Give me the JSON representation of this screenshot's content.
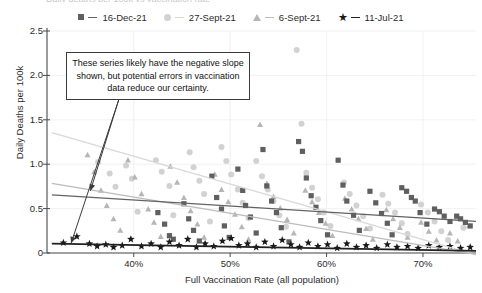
{
  "title_sliver": "Daily deaths per 100k vs vaccination rate",
  "legend": {
    "entries": [
      {
        "label": "16-Dec-21",
        "marker": "square-marker",
        "color": "#5f5f5f",
        "line_color": "#636363"
      },
      {
        "label": "27-Sept-21",
        "marker": "circle-marker",
        "color": "#d2d2d2",
        "line_color": "#d8d8d8"
      },
      {
        "label": "6-Sept-21",
        "marker": "triangle-marker",
        "color": "#b6b6b6",
        "line_color": "#bcbcbc"
      },
      {
        "label": "11-Jul-21",
        "marker": "star-marker",
        "color": "#1a1a1a",
        "line_color": "#202020"
      }
    ]
  },
  "annotation": {
    "text": "These series likely have the negative slope shown, but potential errors in vaccination data reduce our certainty."
  },
  "axes": {
    "y_title": "Daily Deaths per 100k",
    "x_title": "Full Vaccination Rate (all population)",
    "y_ticks": [
      "0",
      "0.5",
      "1.0",
      "1.5",
      "2.0",
      "2.5"
    ],
    "x_ticks": [
      "40%",
      "50%",
      "60%",
      "70%"
    ]
  },
  "chart_data": {
    "type": "scatter",
    "title": "Daily deaths per 100k vs vaccination rate",
    "xlabel": "Full Vaccination Rate (all population)",
    "ylabel": "Daily Deaths per 100k",
    "xlim": [
      0.31,
      0.755
    ],
    "ylim": [
      0,
      2.5
    ],
    "xticks": [
      0.4,
      0.5,
      0.6,
      0.7
    ],
    "xticklabels": [
      "40%",
      "50%",
      "60%",
      "70%"
    ],
    "yticks": [
      0,
      0.5,
      1.0,
      1.5,
      2.0,
      2.5
    ],
    "yticklabels": [
      "0",
      "0.5",
      "1.0",
      "1.5",
      "2.0",
      "2.5"
    ],
    "grid": "both-faint",
    "legend_position": "top-center",
    "annotations": [
      {
        "text": "These series likely have the negative slope shown, but potential errors in vaccination data reduce our certainty.",
        "box_x": 0.335,
        "box_y": 2.22,
        "arrows": [
          {
            "to_x": 0.335,
            "to_y": 0.11
          },
          {
            "to_x": 0.355,
            "to_y": 0.7
          }
        ]
      }
    ],
    "series": [
      {
        "name": "16-Dec-21",
        "marker": "square",
        "color": "#5f5f5f",
        "trendline": {
          "color": "#636363",
          "x0": 0.315,
          "y0": 0.655,
          "x1": 0.755,
          "y1": 0.355
        },
        "points": [
          [
            0.425,
            0.455
          ],
          [
            0.432,
            0.325
          ],
          [
            0.437,
            0.195
          ],
          [
            0.441,
            0.155
          ],
          [
            0.452,
            0.555
          ],
          [
            0.457,
            0.385
          ],
          [
            0.462,
            0.255
          ],
          [
            0.468,
            0.135
          ],
          [
            0.481,
            0.865
          ],
          [
            0.486,
            0.625
          ],
          [
            0.491,
            0.495
          ],
          [
            0.494,
            0.305
          ],
          [
            0.499,
            0.175
          ],
          [
            0.508,
            0.945
          ],
          [
            0.513,
            0.705
          ],
          [
            0.516,
            0.535
          ],
          [
            0.521,
            0.405
          ],
          [
            0.527,
            0.225
          ],
          [
            0.534,
            1.165
          ],
          [
            0.538,
            0.755
          ],
          [
            0.543,
            0.585
          ],
          [
            0.548,
            0.455
          ],
          [
            0.553,
            0.285
          ],
          [
            0.561,
            0.125
          ],
          [
            0.571,
            1.255
          ],
          [
            0.575,
            1.145
          ],
          [
            0.579,
            0.845
          ],
          [
            0.584,
            0.645
          ],
          [
            0.589,
            0.515
          ],
          [
            0.594,
            0.365
          ],
          [
            0.601,
            0.205
          ],
          [
            0.612,
            1.045
          ],
          [
            0.617,
            0.765
          ],
          [
            0.621,
            0.585
          ],
          [
            0.628,
            0.425
          ],
          [
            0.634,
            0.255
          ],
          [
            0.645,
            0.695
          ],
          [
            0.651,
            0.565
          ],
          [
            0.657,
            0.445
          ],
          [
            0.663,
            0.335
          ],
          [
            0.668,
            0.205
          ],
          [
            0.678,
            0.735
          ],
          [
            0.683,
            0.695
          ],
          [
            0.688,
            0.625
          ],
          [
            0.692,
            0.585
          ],
          [
            0.697,
            0.455
          ],
          [
            0.704,
            0.325
          ],
          [
            0.712,
            0.495
          ],
          [
            0.717,
            0.465
          ],
          [
            0.722,
            0.415
          ],
          [
            0.728,
            0.355
          ],
          [
            0.735,
            0.415
          ],
          [
            0.739,
            0.385
          ],
          [
            0.744,
            0.345
          ],
          [
            0.749,
            0.305
          ]
        ]
      },
      {
        "name": "27-Sept-21",
        "marker": "circle",
        "color": "#d2d2d2",
        "trendline": {
          "color": "#d8d8d8",
          "x0": 0.315,
          "y0": 1.355,
          "x1": 0.755,
          "y1": -0.02
        },
        "points": [
          [
            0.363,
            1.025
          ],
          [
            0.375,
            0.895
          ],
          [
            0.381,
            0.745
          ],
          [
            0.392,
            0.985
          ],
          [
            0.398,
            0.835
          ],
          [
            0.404,
            0.465
          ],
          [
            0.423,
            1.045
          ],
          [
            0.429,
            0.915
          ],
          [
            0.437,
            0.755
          ],
          [
            0.441,
            0.425
          ],
          [
            0.458,
            1.135
          ],
          [
            0.462,
            0.965
          ],
          [
            0.468,
            0.815
          ],
          [
            0.473,
            0.665
          ],
          [
            0.479,
            0.355
          ],
          [
            0.491,
            1.195
          ],
          [
            0.496,
            1.035
          ],
          [
            0.501,
            0.885
          ],
          [
            0.508,
            0.715
          ],
          [
            0.513,
            0.565
          ],
          [
            0.519,
            0.395
          ],
          [
            0.527,
            1.035
          ],
          [
            0.533,
            0.865
          ],
          [
            0.539,
            0.715
          ],
          [
            0.545,
            0.585
          ],
          [
            0.551,
            0.425
          ],
          [
            0.558,
            0.295
          ],
          [
            0.569,
            2.285
          ],
          [
            0.574,
            1.455
          ],
          [
            0.579,
            0.905
          ],
          [
            0.585,
            0.735
          ],
          [
            0.591,
            0.605
          ],
          [
            0.597,
            0.455
          ],
          [
            0.604,
            0.305
          ],
          [
            0.618,
            0.795
          ],
          [
            0.624,
            0.665
          ],
          [
            0.631,
            0.535
          ],
          [
            0.638,
            0.415
          ],
          [
            0.645,
            0.275
          ],
          [
            0.658,
            0.655
          ],
          [
            0.664,
            0.555
          ],
          [
            0.671,
            0.455
          ],
          [
            0.678,
            0.335
          ],
          [
            0.684,
            0.215
          ],
          [
            0.698,
            0.545
          ],
          [
            0.705,
            0.455
          ],
          [
            0.712,
            0.355
          ],
          [
            0.719,
            0.245
          ],
          [
            0.726,
            0.145
          ],
          [
            0.735,
            0.395
          ],
          [
            0.742,
            0.285
          ]
        ]
      },
      {
        "name": "6-Sept-21",
        "marker": "triangle",
        "color": "#b6b6b6",
        "trendline": {
          "color": "#bcbcbc",
          "x0": 0.315,
          "y0": 0.785,
          "x1": 0.755,
          "y1": -0.015
        },
        "points": [
          [
            0.352,
            1.105
          ],
          [
            0.359,
            0.915
          ],
          [
            0.366,
            0.705
          ],
          [
            0.372,
            0.535
          ],
          [
            0.379,
            0.385
          ],
          [
            0.386,
            0.255
          ],
          [
            0.394,
            1.045
          ],
          [
            0.401,
            0.855
          ],
          [
            0.408,
            0.665
          ],
          [
            0.415,
            0.495
          ],
          [
            0.421,
            0.345
          ],
          [
            0.428,
            0.185
          ],
          [
            0.438,
            0.975
          ],
          [
            0.445,
            0.795
          ],
          [
            0.452,
            0.625
          ],
          [
            0.459,
            0.475
          ],
          [
            0.466,
            0.325
          ],
          [
            0.473,
            0.175
          ],
          [
            0.484,
            0.885
          ],
          [
            0.491,
            0.715
          ],
          [
            0.498,
            0.575
          ],
          [
            0.505,
            0.435
          ],
          [
            0.512,
            0.295
          ],
          [
            0.519,
            0.155
          ],
          [
            0.531,
            1.445
          ],
          [
            0.538,
            0.785
          ],
          [
            0.545,
            0.635
          ],
          [
            0.552,
            0.505
          ],
          [
            0.559,
            0.375
          ],
          [
            0.566,
            0.225
          ],
          [
            0.578,
            0.705
          ],
          [
            0.585,
            0.575
          ],
          [
            0.592,
            0.455
          ],
          [
            0.599,
            0.335
          ],
          [
            0.606,
            0.195
          ],
          [
            0.619,
            0.615
          ],
          [
            0.626,
            0.495
          ],
          [
            0.633,
            0.385
          ],
          [
            0.641,
            0.275
          ],
          [
            0.648,
            0.155
          ],
          [
            0.662,
            0.485
          ],
          [
            0.669,
            0.385
          ],
          [
            0.676,
            0.285
          ],
          [
            0.684,
            0.175
          ],
          [
            0.698,
            0.345
          ],
          [
            0.706,
            0.245
          ],
          [
            0.714,
            0.145
          ],
          [
            0.728,
            0.225
          ],
          [
            0.736,
            0.135
          ],
          [
            0.748,
            0.305
          ]
        ]
      },
      {
        "name": "11-Jul-21",
        "marker": "star",
        "color": "#1a1a1a",
        "trendline": {
          "color": "#202020",
          "x0": 0.315,
          "y0": 0.105,
          "x1": 0.755,
          "y1": 0.025
        },
        "points": [
          [
            0.327,
            0.115
          ],
          [
            0.341,
            0.185
          ],
          [
            0.354,
            0.105
          ],
          [
            0.362,
            0.075
          ],
          [
            0.371,
            0.095
          ],
          [
            0.379,
            0.065
          ],
          [
            0.388,
            0.085
          ],
          [
            0.397,
            0.155
          ],
          [
            0.408,
            0.075
          ],
          [
            0.418,
            0.105
          ],
          [
            0.428,
            0.065
          ],
          [
            0.437,
            0.125
          ],
          [
            0.447,
            0.085
          ],
          [
            0.456,
            0.155
          ],
          [
            0.465,
            0.065
          ],
          [
            0.474,
            0.105
          ],
          [
            0.483,
            0.075
          ],
          [
            0.492,
            0.135
          ],
          [
            0.501,
            0.165
          ],
          [
            0.509,
            0.085
          ],
          [
            0.518,
            0.105
          ],
          [
            0.527,
            0.065
          ],
          [
            0.536,
            0.125
          ],
          [
            0.545,
            0.075
          ],
          [
            0.554,
            0.145
          ],
          [
            0.563,
            0.095
          ],
          [
            0.572,
            0.065
          ],
          [
            0.581,
            0.115
          ],
          [
            0.591,
            0.075
          ],
          [
            0.601,
            0.095
          ],
          [
            0.611,
            0.055
          ],
          [
            0.621,
            0.105
          ],
          [
            0.631,
            0.065
          ],
          [
            0.641,
            0.085
          ],
          [
            0.652,
            0.055
          ],
          [
            0.663,
            0.095
          ],
          [
            0.673,
            0.065
          ],
          [
            0.684,
            0.075
          ],
          [
            0.695,
            0.055
          ],
          [
            0.706,
            0.085
          ],
          [
            0.717,
            0.065
          ],
          [
            0.728,
            0.075
          ],
          [
            0.739,
            0.055
          ],
          [
            0.749,
            0.065
          ]
        ]
      }
    ]
  }
}
